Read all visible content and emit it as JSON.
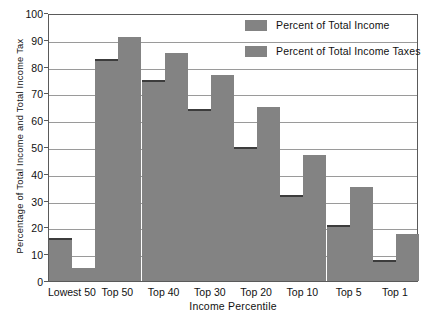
{
  "chart_data": {
    "type": "bar",
    "title": "",
    "xlabel": "Income Percentile",
    "ylabel": "Percentage of Total Income and Total Income Tax",
    "ylim": [
      0,
      100
    ],
    "ytick_step": 10,
    "grid": true,
    "legend_position": "inside-top-right",
    "categories": [
      "Lowest 50",
      "Top 50",
      "Top 40",
      "Top 30",
      "Top 20",
      "Top 10",
      "Top 5",
      "Top 1"
    ],
    "series": [
      {
        "name": "Percent of Total Income",
        "color": "#838383",
        "values": [
          16,
          83,
          75,
          64,
          50,
          32,
          21,
          8
        ]
      },
      {
        "name": "Percent of Total Income Taxes",
        "color": "#838383",
        "values": [
          5,
          91,
          85,
          77,
          65,
          47,
          35,
          17.5
        ]
      }
    ],
    "ytick_labels": [
      "0",
      "10",
      "20",
      "30",
      "40",
      "50",
      "60",
      "70",
      "80",
      "90",
      "100"
    ]
  },
  "legend": {
    "entries": [
      {
        "label": "Percent of Total Income"
      },
      {
        "label": "Percent of Total Income Taxes"
      }
    ]
  },
  "axes": {
    "y_title": "Percentage of Total Income and Total Income Tax",
    "x_title": "Income Percentile"
  }
}
